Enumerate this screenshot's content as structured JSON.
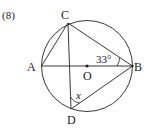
{
  "problem_number": "(8)",
  "points": {
    "A": "A",
    "B": "B",
    "C": "C",
    "D": "D",
    "O": "O"
  },
  "angle_given": "33°",
  "angle_unknown": "x",
  "colors": {
    "stroke": "#222222"
  }
}
